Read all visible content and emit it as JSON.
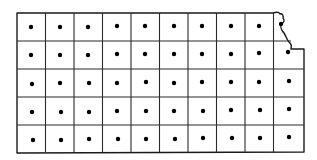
{
  "diagram": {
    "type": "gridded-state-map",
    "shape": "Kansas outline",
    "rows": 5,
    "cols": 10,
    "colors": {
      "background": "#ffffff",
      "line": "#1a1a1a",
      "dot": "#000000"
    },
    "bounds": {
      "left": 17,
      "top": 13,
      "bottom": 152
    },
    "col_lines": [
      17,
      45.5,
      74,
      102.5,
      131,
      159.5,
      188,
      216.5,
      245,
      273.5
    ],
    "row_lines": [
      13,
      41,
      69,
      97,
      125,
      152
    ],
    "right_edge_x_by_row": [
      300,
      304,
      304,
      304,
      304
    ],
    "dots": [
      [
        31,
        27
      ],
      [
        60,
        27
      ],
      [
        88,
        27
      ],
      [
        117,
        26
      ],
      [
        145,
        26
      ],
      [
        174,
        26
      ],
      [
        202,
        26
      ],
      [
        231,
        26
      ],
      [
        259,
        26
      ],
      [
        281,
        24
      ],
      [
        31,
        55
      ],
      [
        60,
        55
      ],
      [
        88,
        55
      ],
      [
        117,
        54
      ],
      [
        145,
        54
      ],
      [
        174,
        54
      ],
      [
        202,
        54
      ],
      [
        231,
        54
      ],
      [
        259,
        53
      ],
      [
        288,
        52
      ],
      [
        32,
        84
      ],
      [
        60,
        83
      ],
      [
        89,
        83
      ],
      [
        117,
        83
      ],
      [
        146,
        82
      ],
      [
        174,
        83
      ],
      [
        202,
        82
      ],
      [
        231,
        82
      ],
      [
        259,
        82
      ],
      [
        289,
        81
      ],
      [
        32,
        112
      ],
      [
        61,
        112
      ],
      [
        89,
        112
      ],
      [
        117,
        111
      ],
      [
        146,
        111
      ],
      [
        174,
        111
      ],
      [
        203,
        111
      ],
      [
        231,
        110
      ],
      [
        260,
        110
      ],
      [
        289,
        109
      ],
      [
        33,
        140
      ],
      [
        61,
        140
      ],
      [
        89,
        139
      ],
      [
        118,
        139
      ],
      [
        146,
        139
      ],
      [
        175,
        139
      ],
      [
        203,
        138
      ],
      [
        232,
        138
      ],
      [
        260,
        138
      ],
      [
        289,
        137
      ]
    ]
  }
}
